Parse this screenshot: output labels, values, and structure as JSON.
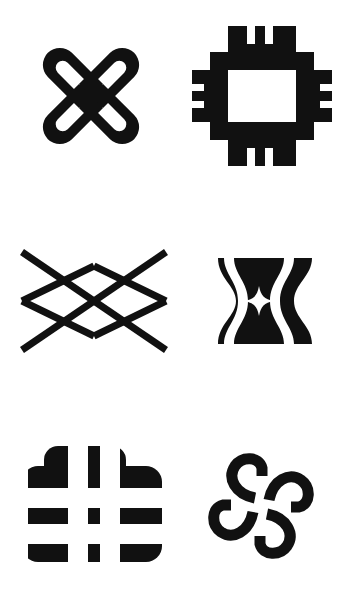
{
  "page": {
    "background_color": "#ffffff",
    "ink_color": "#111111",
    "width": 337,
    "height": 601,
    "columns": 2,
    "rows": 3,
    "caption": ""
  },
  "symbols": [
    {
      "id": "symbol-1",
      "position": "row-1-col-1",
      "name": "looped-x-cross",
      "description": "Thick X-shaped cross with rounded arm tips; each of the four arms contains an elongated rounded slot cutout.",
      "fill": "#111111",
      "stroke_width": 0
    },
    {
      "id": "symbol-2",
      "position": "row-1-col-2",
      "name": "square-frame-with-combed-tabs",
      "description": "Open square ring frame with a solid rectangular tab at the middle of each side; each tab is slotted like a comb with two cuts.",
      "fill": "#111111",
      "stroke_width": 0
    },
    {
      "id": "symbol-3",
      "position": "row-2-col-1",
      "name": "double-x-lattice",
      "description": "Two thin elongated X strokes overlapping to form a wide lattice with a central diamond void.",
      "fill": "#111111",
      "stroke_width": 0
    },
    {
      "id": "symbol-4",
      "position": "row-2-col-2",
      "name": "hourglass-block-star",
      "description": "Solid rectangular block with two hourglass-shaped white cutouts flanking a four-pointed star void at the center.",
      "fill": "#111111",
      "stroke_width": 0
    },
    {
      "id": "symbol-5",
      "position": "row-3-col-1",
      "name": "rounded-block-hash",
      "description": "Rounded-corner black block with a bold white hash or tic-tac-toe grid cut through it.",
      "fill": "#111111",
      "stroke_width": 0
    },
    {
      "id": "symbol-6",
      "position": "row-3-col-2",
      "name": "four-hooked-spiral-cross",
      "description": "Four-fold rotationally symmetric cross whose arms terminate in curled hooks, with a small square void at the center.",
      "fill": "#111111",
      "stroke_width": 0
    }
  ]
}
